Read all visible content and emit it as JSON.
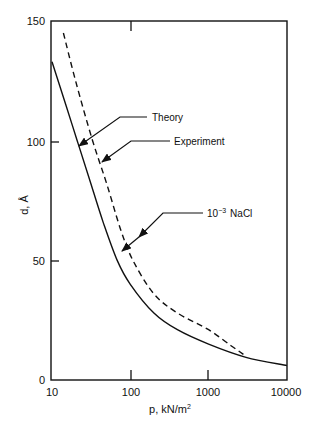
{
  "chart_data": {
    "type": "line",
    "title": "",
    "xlabel": "p, kN/m²",
    "ylabel": "d, Å",
    "xscale": "log",
    "xlim": [
      10,
      10000
    ],
    "ylim": [
      0,
      150
    ],
    "x_ticks": [
      "10",
      "100",
      "1000",
      "10000"
    ],
    "y_ticks": [
      "0",
      "50",
      "100",
      "150"
    ],
    "grid": false,
    "legend": "none (curves labelled by arrow annotations)",
    "series": [
      {
        "name": "Theory",
        "style": "solid",
        "points": [
          [
            10,
            133
          ],
          [
            15,
            115
          ],
          [
            21,
            100
          ],
          [
            30,
            84
          ],
          [
            45,
            66
          ],
          [
            68,
            50
          ],
          [
            100,
            40
          ],
          [
            200,
            28
          ],
          [
            400,
            21
          ],
          [
            1000,
            15
          ],
          [
            3000,
            9.5
          ],
          [
            10000,
            6
          ]
        ]
      },
      {
        "name": "Experiment",
        "style": "dashed",
        "points": [
          [
            14,
            145
          ],
          [
            20,
            125
          ],
          [
            33,
            100
          ],
          [
            50,
            82
          ],
          [
            75,
            63
          ],
          [
            108,
            50
          ],
          [
            200,
            36
          ],
          [
            400,
            28
          ],
          [
            1000,
            21
          ],
          [
            2000,
            14
          ],
          [
            3000,
            10
          ]
        ]
      }
    ],
    "annotations": [
      {
        "text": "Theory",
        "points_to": "Theory",
        "arrow_at": [
          20,
          100
        ]
      },
      {
        "text": "Experiment",
        "points_to": "Experiment",
        "arrow_at": [
          40,
          90
        ]
      },
      {
        "text": "10⁻³ NaCl",
        "points_to": "both curves",
        "arrow_at": [
          [
            130,
            60
          ],
          [
            85,
            55
          ]
        ]
      }
    ]
  },
  "axes": {
    "x_label_text": "p, kN/m",
    "x_label_sup": "2",
    "y_label_text": "d, Å"
  },
  "labels": {
    "theory": "Theory",
    "experiment": "Experiment",
    "nacl_base": "10",
    "nacl_exp": "−3",
    "nacl_text": "NaCl"
  }
}
